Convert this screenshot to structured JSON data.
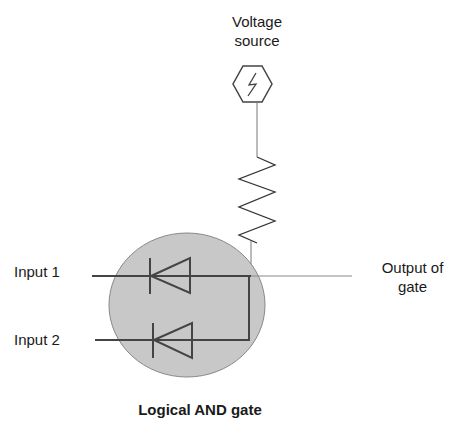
{
  "diagram": {
    "title": "Logical AND gate",
    "voltage_source": {
      "label_line1": "Voltage",
      "label_line2": "source",
      "icon": "lightning-icon"
    },
    "inputs": [
      {
        "label": "Input 1"
      },
      {
        "label": "Input 2"
      }
    ],
    "output": {
      "label_line1": "Output of",
      "label_line2": "gate"
    },
    "colors": {
      "circle_fill": "#c8c8c8",
      "line": "#444444",
      "background": "#ffffff"
    }
  }
}
